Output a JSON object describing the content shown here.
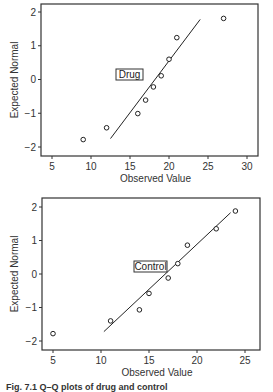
{
  "chart_data": [
    {
      "type": "scatter",
      "subtype": "normal-qq-plot",
      "label_box": "Drug",
      "xlabel": "Observed Value",
      "ylabel": "Expected Normal",
      "xlim": [
        3,
        31.5
      ],
      "ylim": [
        -2.25,
        2.25
      ],
      "xticks": [
        5,
        10,
        15,
        20,
        25,
        30
      ],
      "yticks": [
        -2,
        -1,
        0,
        1,
        2
      ],
      "grid": false,
      "points": [
        {
          "x": 9,
          "y": -1.78
        },
        {
          "x": 12,
          "y": -1.43
        },
        {
          "x": 16,
          "y": -1.01
        },
        {
          "x": 17,
          "y": -0.61
        },
        {
          "x": 18,
          "y": -0.22
        },
        {
          "x": 19,
          "y": 0.11
        },
        {
          "x": 20,
          "y": 0.6
        },
        {
          "x": 21,
          "y": 1.24
        },
        {
          "x": 27,
          "y": 1.81
        }
      ],
      "reference_line": {
        "x1": 12.5,
        "y1": -1.75,
        "x2": 24,
        "y2": 1.78
      }
    },
    {
      "type": "scatter",
      "subtype": "normal-qq-plot",
      "label_box": "Control",
      "xlabel": "Observed Value",
      "ylabel": "Expected Normal",
      "xlim": [
        4,
        26.5
      ],
      "ylim": [
        -2.25,
        2.25
      ],
      "xticks": [
        5,
        10,
        15,
        20,
        25
      ],
      "yticks": [
        -2,
        -1,
        0,
        1,
        2
      ],
      "grid": false,
      "points": [
        {
          "x": 5,
          "y": -1.78
        },
        {
          "x": 11,
          "y": -1.4
        },
        {
          "x": 14,
          "y": -1.07
        },
        {
          "x": 15,
          "y": -0.58
        },
        {
          "x": 17,
          "y": -0.12
        },
        {
          "x": 18,
          "y": 0.31
        },
        {
          "x": 19,
          "y": 0.86
        },
        {
          "x": 22,
          "y": 1.35
        },
        {
          "x": 24,
          "y": 1.88
        }
      ],
      "reference_line": {
        "x1": 10.3,
        "y1": -1.72,
        "x2": 23.5,
        "y2": 1.83
      }
    }
  ],
  "caption": "Fig. 7.1  Q–Q plots of drug and control"
}
